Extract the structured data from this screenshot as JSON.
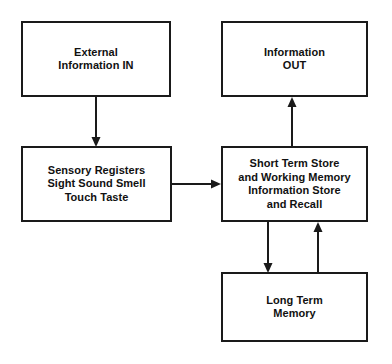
{
  "diagram": {
    "type": "flowchart",
    "background_color": "#ffffff",
    "line_color": "#1a1a1a",
    "text_color": "#111111",
    "nodes": [
      {
        "id": "external-information-in",
        "label": "External\nInformation IN",
        "x": 21,
        "y": 21,
        "width": 150,
        "height": 76
      },
      {
        "id": "information-out",
        "label": "Information\nOUT",
        "x": 221,
        "y": 21,
        "width": 147,
        "height": 76
      },
      {
        "id": "sensory-registers",
        "label": "Sensory Registers\nSight Sound Smell\nTouch Taste",
        "x": 21,
        "y": 146,
        "width": 151,
        "height": 76
      },
      {
        "id": "short-term-store",
        "label": "Short Term Store\nand Working Memory\nInformation Store\nand Recall",
        "x": 221,
        "y": 146,
        "width": 147,
        "height": 76
      },
      {
        "id": "long-term-memory",
        "label": "Long Term\nMemory",
        "x": 221,
        "y": 272,
        "width": 147,
        "height": 70
      }
    ],
    "edges": [
      {
        "id": "edge-external-to-sensory",
        "from": "external-information-in",
        "to": "sensory-registers",
        "direction": "down"
      },
      {
        "id": "edge-sensory-to-short-term",
        "from": "sensory-registers",
        "to": "short-term-store",
        "direction": "right"
      },
      {
        "id": "edge-short-term-to-information-out",
        "from": "short-term-store",
        "to": "information-out",
        "direction": "up"
      },
      {
        "id": "edge-short-term-to-long-term",
        "from": "short-term-store",
        "to": "long-term-memory",
        "direction": "down"
      },
      {
        "id": "edge-long-term-to-short-term",
        "from": "long-term-memory",
        "to": "short-term-store",
        "direction": "up"
      }
    ]
  }
}
